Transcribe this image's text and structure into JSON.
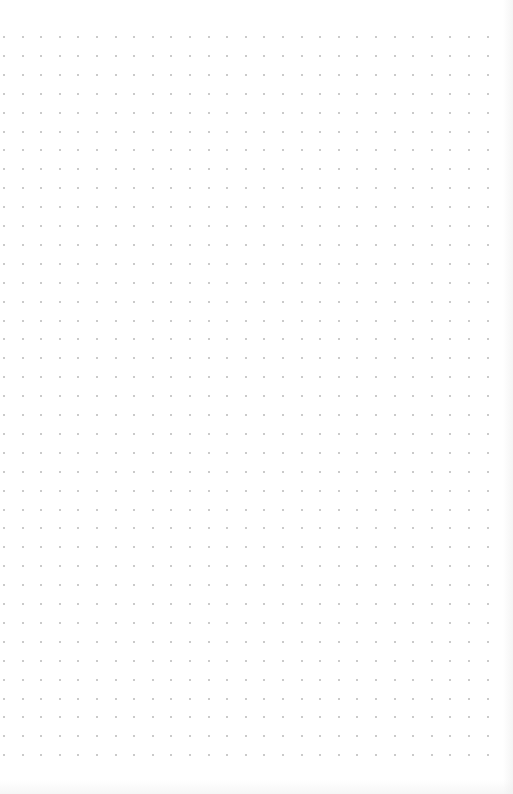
{
  "page": {
    "type": "dot-grid-paper",
    "background_color": "#ffffff"
  },
  "grid": {
    "dot_color": "#b8b8b8",
    "dot_size_px": 2,
    "spacing_x_px": 18.6,
    "spacing_y_px": 18.9,
    "origin_x_px": 4,
    "origin_y_px": 37,
    "columns": 27,
    "rows": 39
  }
}
